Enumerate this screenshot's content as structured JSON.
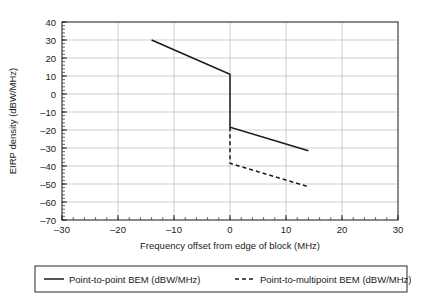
{
  "chart_data": {
    "type": "line",
    "title": "",
    "xlabel": "Frequency offset from edge of block (MHz)",
    "ylabel": "EIRP density (dBW/MHz)",
    "xlim": [
      -30,
      30
    ],
    "ylim": [
      -70,
      40
    ],
    "xticks": [
      -30,
      -20,
      -10,
      0,
      10,
      20,
      30
    ],
    "xtick_labels": [
      "–30",
      "–20",
      "–10",
      "0",
      "10",
      "20",
      "30"
    ],
    "yticks": [
      -70,
      -60,
      -50,
      -40,
      -30,
      -20,
      -10,
      0,
      10,
      20,
      30,
      40
    ],
    "ytick_labels": [
      "–70",
      "–60",
      "–50",
      "–40",
      "–30",
      "–20",
      "–10",
      "0",
      "10",
      "20",
      "30",
      "40"
    ],
    "x_minor_step": 2,
    "y_minor_step": 2,
    "grid": true,
    "grid_axis": "both",
    "legend_position": "below",
    "series": [
      {
        "name": "Point-to-point BEM (dBW/MHz)",
        "style": "solid",
        "color": "#1a1a1a",
        "points": [
          [
            -14,
            30
          ],
          [
            0,
            11
          ],
          [
            0,
            -18.5
          ],
          [
            14,
            -31.5
          ]
        ]
      },
      {
        "name": "Point-to-multipoint BEM (dBW/MHz)",
        "style": "dashed",
        "color": "#1a1a1a",
        "points": [
          [
            0,
            -18.5
          ],
          [
            0,
            -38.5
          ],
          [
            14,
            -51.5
          ]
        ]
      }
    ]
  },
  "legend": {
    "entries": [
      {
        "label": "Point-to-point BEM (dBW/MHz)",
        "style": "solid"
      },
      {
        "label": "Point-to-multipoint BEM (dBW/MHz)",
        "style": "dashed"
      }
    ]
  }
}
